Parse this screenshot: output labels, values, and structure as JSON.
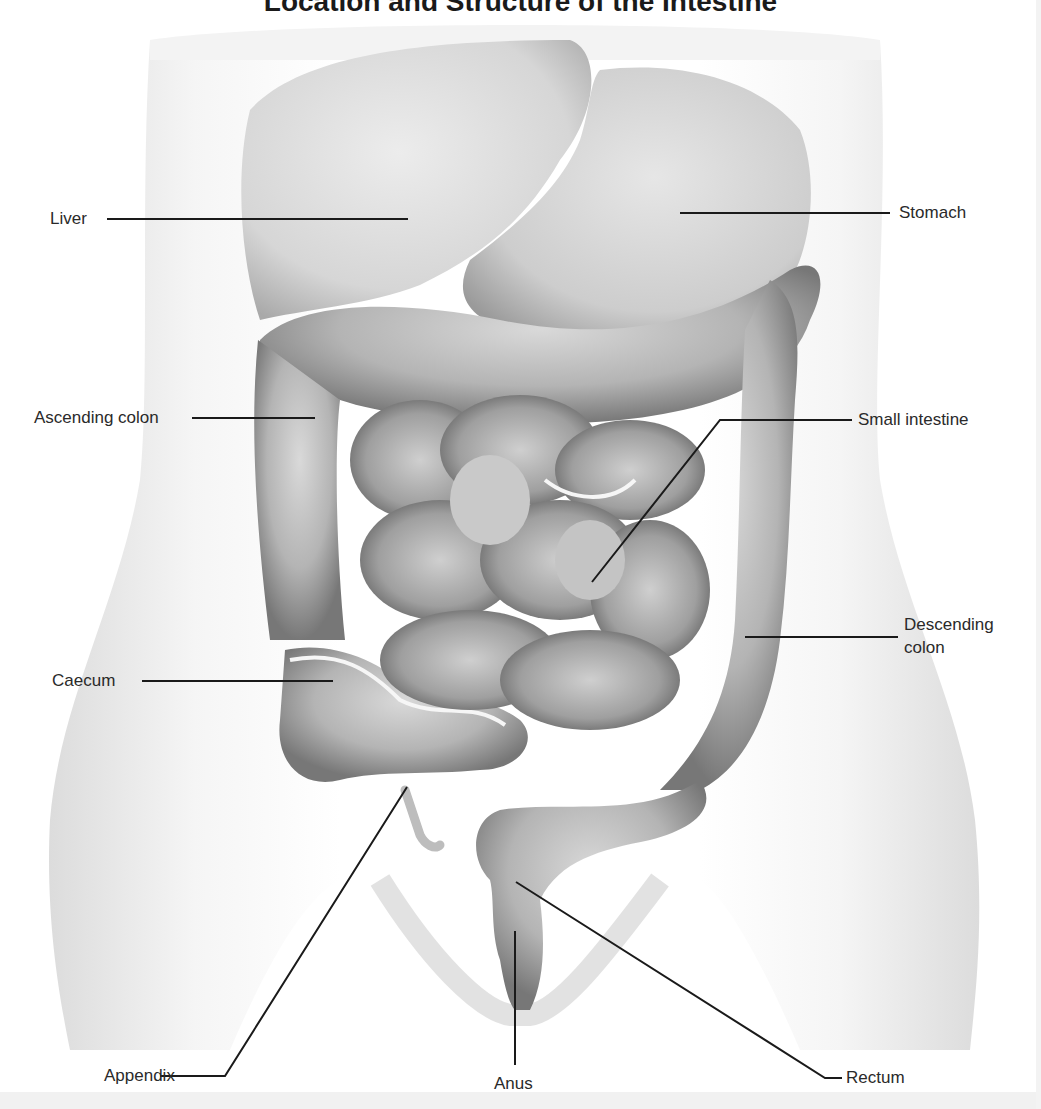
{
  "diagram": {
    "title": "Location and Structure of the Intestine",
    "title_visible_text": "Location and Structure of the Intestine",
    "style": "grayscale anatomical illustration, anterior view of torso",
    "colors": {
      "background": "#ffffff",
      "body_silhouette": "#e4e4e4",
      "organ_light": "#d4d4d4",
      "organ_mid": "#a8a8a8",
      "organ_dark": "#6e6e6e",
      "leader_line": "#1a1a1a",
      "label_text": "#2a2a2a"
    },
    "labels": [
      {
        "id": "liver",
        "text": "Liver",
        "side": "left"
      },
      {
        "id": "stomach",
        "text": "Stomach",
        "side": "right"
      },
      {
        "id": "ascending-colon",
        "text": "Ascending colon",
        "side": "left"
      },
      {
        "id": "small-intestine",
        "text": "Small intestine",
        "side": "right"
      },
      {
        "id": "descending-colon",
        "text": "Descending colon",
        "text_line1": "Descending",
        "text_line2": "colon",
        "side": "right"
      },
      {
        "id": "caecum",
        "text": "Caecum",
        "side": "left"
      },
      {
        "id": "appendix",
        "text": "Appendix",
        "side": "bottom-left"
      },
      {
        "id": "anus",
        "text": "Anus",
        "side": "bottom-center"
      },
      {
        "id": "rectum",
        "text": "Rectum",
        "side": "bottom-right"
      }
    ]
  }
}
